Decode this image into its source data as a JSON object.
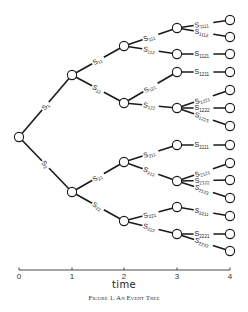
{
  "figure": {
    "caption": "Figure 1. An Event Tree",
    "xlabel": "time",
    "axis": {
      "y": 270,
      "ticks": [
        {
          "label": "0",
          "x": 19
        },
        {
          "label": "1",
          "x": 72
        },
        {
          "label": "2",
          "x": 124
        },
        {
          "label": "3",
          "x": 177
        },
        {
          "label": "4",
          "x": 230
        }
      ]
    },
    "colors": {
      "line": "#1a1a1a",
      "node_fill": "#ffffff",
      "background": "#ffffff"
    }
  },
  "tree": {
    "nodes": [
      {
        "id": "root",
        "x": 19,
        "y": 137
      },
      {
        "id": "1",
        "x": 72,
        "y": 75
      },
      {
        "id": "2",
        "x": 72,
        "y": 192
      },
      {
        "id": "11",
        "x": 124,
        "y": 46
      },
      {
        "id": "12",
        "x": 124,
        "y": 103
      },
      {
        "id": "21",
        "x": 124,
        "y": 162
      },
      {
        "id": "22",
        "x": 124,
        "y": 221
      },
      {
        "id": "111",
        "x": 177,
        "y": 28
      },
      {
        "id": "112",
        "x": 177,
        "y": 54
      },
      {
        "id": "121",
        "x": 177,
        "y": 72
      },
      {
        "id": "122",
        "x": 177,
        "y": 108
      },
      {
        "id": "211",
        "x": 177,
        "y": 145
      },
      {
        "id": "212",
        "x": 177,
        "y": 181
      },
      {
        "id": "221",
        "x": 177,
        "y": 207
      },
      {
        "id": "222",
        "x": 177,
        "y": 234
      },
      {
        "id": "1111",
        "x": 230,
        "y": 20
      },
      {
        "id": "1112",
        "x": 230,
        "y": 37
      },
      {
        "id": "1121",
        "x": 230,
        "y": 54
      },
      {
        "id": "1211",
        "x": 230,
        "y": 72
      },
      {
        "id": "1221",
        "x": 230,
        "y": 90
      },
      {
        "id": "1222",
        "x": 230,
        "y": 108
      },
      {
        "id": "1223",
        "x": 230,
        "y": 126
      },
      {
        "id": "2111",
        "x": 230,
        "y": 145
      },
      {
        "id": "2121",
        "x": 230,
        "y": 163
      },
      {
        "id": "2122",
        "x": 230,
        "y": 180
      },
      {
        "id": "2123",
        "x": 230,
        "y": 198
      },
      {
        "id": "2211",
        "x": 230,
        "y": 216
      },
      {
        "id": "2221",
        "x": 230,
        "y": 234
      },
      {
        "id": "2222",
        "x": 230,
        "y": 251
      }
    ],
    "edges": [
      {
        "from": "root",
        "to": "1",
        "label": "S",
        "sub": "1"
      },
      {
        "from": "root",
        "to": "2",
        "label": "S",
        "sub": "2"
      },
      {
        "from": "1",
        "to": "11",
        "label": "S",
        "sub": "11"
      },
      {
        "from": "1",
        "to": "12",
        "label": "S",
        "sub": "12"
      },
      {
        "from": "2",
        "to": "21",
        "label": "S",
        "sub": "21"
      },
      {
        "from": "2",
        "to": "22",
        "label": "S",
        "sub": "22"
      },
      {
        "from": "11",
        "to": "111",
        "label": "S",
        "sub": "111"
      },
      {
        "from": "11",
        "to": "112",
        "label": "S",
        "sub": "112"
      },
      {
        "from": "12",
        "to": "121",
        "label": "S",
        "sub": "121"
      },
      {
        "from": "12",
        "to": "122",
        "label": "S",
        "sub": "122"
      },
      {
        "from": "21",
        "to": "211",
        "label": "S",
        "sub": "211"
      },
      {
        "from": "21",
        "to": "212",
        "label": "S",
        "sub": "212"
      },
      {
        "from": "22",
        "to": "221",
        "label": "S",
        "sub": "221"
      },
      {
        "from": "22",
        "to": "222",
        "label": "S",
        "sub": "222"
      },
      {
        "from": "111",
        "to": "1111",
        "label": "S",
        "sub": "1111"
      },
      {
        "from": "111",
        "to": "1112",
        "label": "S",
        "sub": "1112"
      },
      {
        "from": "112",
        "to": "1121",
        "label": "S",
        "sub": "1121"
      },
      {
        "from": "121",
        "to": "1211",
        "label": "S",
        "sub": "1211"
      },
      {
        "from": "122",
        "to": "1221",
        "label": "S",
        "sub": "1221"
      },
      {
        "from": "122",
        "to": "1222",
        "label": "S",
        "sub": "1222"
      },
      {
        "from": "122",
        "to": "1223",
        "label": "S",
        "sub": "1223"
      },
      {
        "from": "211",
        "to": "2111",
        "label": "S",
        "sub": "2111"
      },
      {
        "from": "212",
        "to": "2121",
        "label": "S",
        "sub": "2121"
      },
      {
        "from": "212",
        "to": "2122",
        "label": "S",
        "sub": "2122"
      },
      {
        "from": "212",
        "to": "2123",
        "label": "S",
        "sub": "2123"
      },
      {
        "from": "221",
        "to": "2211",
        "label": "S",
        "sub": "2211"
      },
      {
        "from": "222",
        "to": "2221",
        "label": "S",
        "sub": "2221"
      },
      {
        "from": "222",
        "to": "2222",
        "label": "S",
        "sub": "2222"
      }
    ]
  }
}
